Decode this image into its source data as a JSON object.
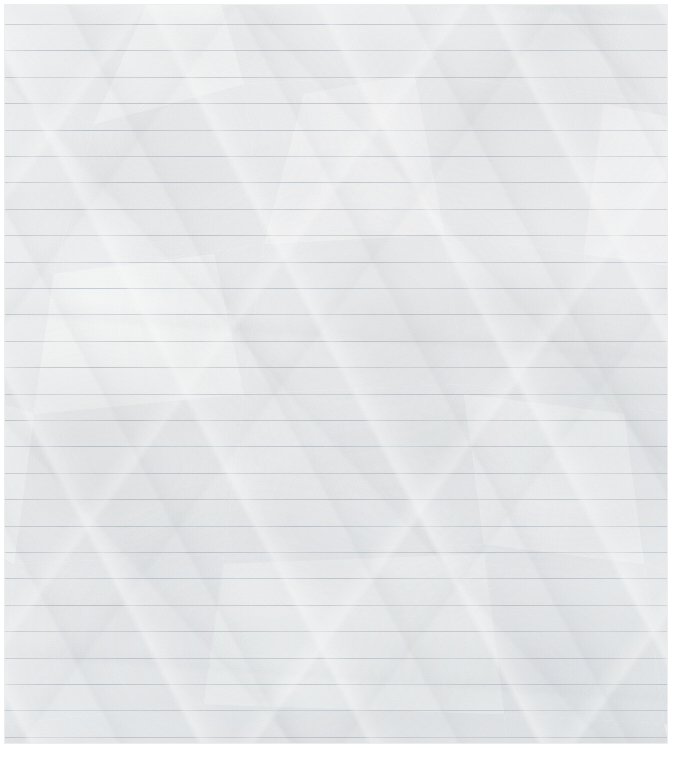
{
  "document": {
    "kind": "blank-ruled-notebook-paper",
    "title": "Blank Ruled Paper",
    "surface_state": "crumpled",
    "has_written_content": false,
    "body_text": "",
    "margin_rule": "none",
    "orientation": "portrait"
  },
  "canvas": {
    "width": 674,
    "height": 758,
    "background_color": "#ffffff"
  },
  "sheet": {
    "left": 4,
    "top": 4,
    "width": 664,
    "height": 740,
    "paper_color": "#fafbfb",
    "edge_color": "#ebeef0"
  },
  "ruling": {
    "line_color": "#c9ced3",
    "line_count": 28,
    "first_line_y": 20,
    "line_spacing": 26.4,
    "line_thickness": 1,
    "spans_full_width": true
  },
  "texture": {
    "crease_shadow_color": "#828a92",
    "fold_facet_color": "#e8eaec",
    "highlight_color": "#ffffff",
    "grain_color": "#9aa2aa",
    "primary_crease_direction": "lower-left to upper-right",
    "secondary_crease_direction": "upper-left to lower-right"
  }
}
